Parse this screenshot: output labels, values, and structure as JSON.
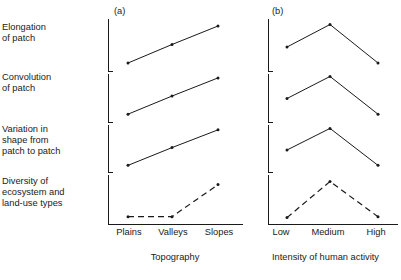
{
  "figure": {
    "row_labels": [
      "Elongation\nof patch",
      "Convolution\nof patch",
      "Variation in\n   shape from\n   patch to patch",
      "Diversity of\n   ecosystem and\n   land-use types"
    ],
    "panels": [
      {
        "caption": "(a)",
        "xlabel": "Topography",
        "categories": [
          "Plains",
          "Valleys",
          "Slopes"
        ]
      },
      {
        "caption": "(b)",
        "xlabel": "Intensity of human activity",
        "categories": [
          "Low",
          "Medium",
          "High"
        ]
      }
    ]
  },
  "chart_data": [
    {
      "type": "line",
      "panel": "(a)",
      "title": "",
      "xlabel": "Topography",
      "ylabel": "",
      "categories": [
        "Plains",
        "Valleys",
        "Slopes"
      ],
      "grid": false,
      "legend": "none",
      "axis_style": "bracketed-segments",
      "ylim": [
        0,
        1
      ],
      "series": [
        {
          "name": "Elongation of patch",
          "style": "solid",
          "values": [
            0.18,
            0.55,
            0.92
          ]
        },
        {
          "name": "Convolution of patch",
          "style": "solid",
          "values": [
            0.18,
            0.55,
            0.92
          ]
        },
        {
          "name": "Variation in shape from patch to patch",
          "style": "solid",
          "values": [
            0.18,
            0.55,
            0.92
          ]
        },
        {
          "name": "Diversity of ecosystem and land-use types",
          "style": "dashed",
          "values": [
            0.12,
            0.12,
            0.85
          ]
        }
      ]
    },
    {
      "type": "line",
      "panel": "(b)",
      "title": "",
      "xlabel": "Intensity of human activity",
      "ylabel": "",
      "categories": [
        "Low",
        "Medium",
        "High"
      ],
      "grid": false,
      "legend": "none",
      "axis_style": "bracketed-segments",
      "ylim": [
        0,
        1
      ],
      "series": [
        {
          "name": "Elongation of patch",
          "style": "solid",
          "values": [
            0.5,
            0.95,
            0.18
          ]
        },
        {
          "name": "Convolution of patch",
          "style": "solid",
          "values": [
            0.5,
            0.95,
            0.18
          ]
        },
        {
          "name": "Variation in shape from patch to patch",
          "style": "solid",
          "values": [
            0.5,
            0.95,
            0.18
          ]
        },
        {
          "name": "Diversity of ecosystem and land-use types",
          "style": "dashed",
          "values": [
            0.1,
            0.92,
            0.12
          ]
        }
      ]
    }
  ]
}
